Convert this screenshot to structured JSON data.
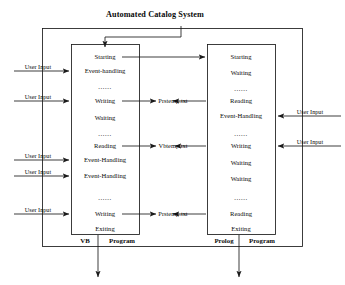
{
  "title": "Automated Catalog System",
  "vb_program": {
    "legend_language": "VB",
    "legend_kind": "Program",
    "states": [
      "Starting",
      "Event-handling",
      "......",
      "Writing",
      "Waiting",
      "......",
      "Reading",
      "Event-Handling",
      "Event-Handling",
      "......",
      "Writing",
      "Exiting"
    ]
  },
  "prolog_program": {
    "legend_language": "Prolog",
    "legend_kind": "Program",
    "states": [
      "Starting",
      "Waiting",
      "......",
      "Reading",
      "Event-Handling",
      "......",
      "Writing",
      "Waiting",
      "Waiting",
      "......",
      "Reading",
      "Exiting"
    ]
  },
  "files": [
    {
      "name": "Prstemp.txt"
    },
    {
      "name": "Vbtemp.txt"
    },
    {
      "name": "Prstemp.txt"
    }
  ],
  "left_user_inputs": [
    {
      "label": "User Input"
    },
    {
      "label": "User Input"
    },
    {
      "label": "User Input"
    },
    {
      "label": "User Input"
    },
    {
      "label": "User Input"
    }
  ],
  "right_user_inputs": [
    {
      "label": "User Input"
    },
    {
      "label": "User Input"
    }
  ],
  "colors": {
    "stroke": "#1a1a1a",
    "text": "#0a0a0a",
    "background": "#ffffff"
  }
}
